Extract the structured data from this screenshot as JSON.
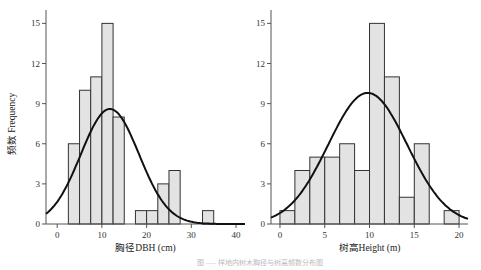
{
  "figure": {
    "ylabel": "频数 Frequency",
    "caption": "图 ‒‒‒ 样地内树木胸径与树高频数分布图"
  },
  "chart_data": [
    {
      "type": "bar",
      "subtype": "histogram-with-normal-curve",
      "xlabel": "胸径DBH (cm)",
      "ylabel": "频数 Frequency",
      "xlim": [
        -2.5,
        42
      ],
      "ylim": [
        0,
        16
      ],
      "xticks": [
        0,
        10,
        20,
        30,
        40
      ],
      "yticks": [
        0,
        3,
        6,
        9,
        12,
        15
      ],
      "bin_width": 2.5,
      "bin_start": 2.5,
      "values": [
        6,
        10,
        11,
        15,
        8,
        0,
        1,
        1,
        3,
        4,
        0,
        0,
        1
      ],
      "curve": {
        "type": "normal",
        "mean": 11.8,
        "sd": 6.5,
        "peak": 8.6
      }
    },
    {
      "type": "bar",
      "subtype": "histogram-with-normal-curve",
      "xlabel": "树高Height (m)",
      "ylabel": "",
      "xlim": [
        -1,
        21
      ],
      "ylim": [
        0,
        16
      ],
      "xticks": [
        0,
        5,
        10,
        15,
        20
      ],
      "yticks": [
        0,
        3,
        6,
        9,
        12,
        15
      ],
      "bin_width": 1.667,
      "bin_start": 0,
      "values": [
        1,
        4,
        5,
        5,
        6,
        4,
        15,
        11,
        2,
        6,
        0,
        1
      ],
      "curve": {
        "type": "normal",
        "mean": 9.8,
        "sd": 4.4,
        "peak": 9.8
      }
    }
  ]
}
